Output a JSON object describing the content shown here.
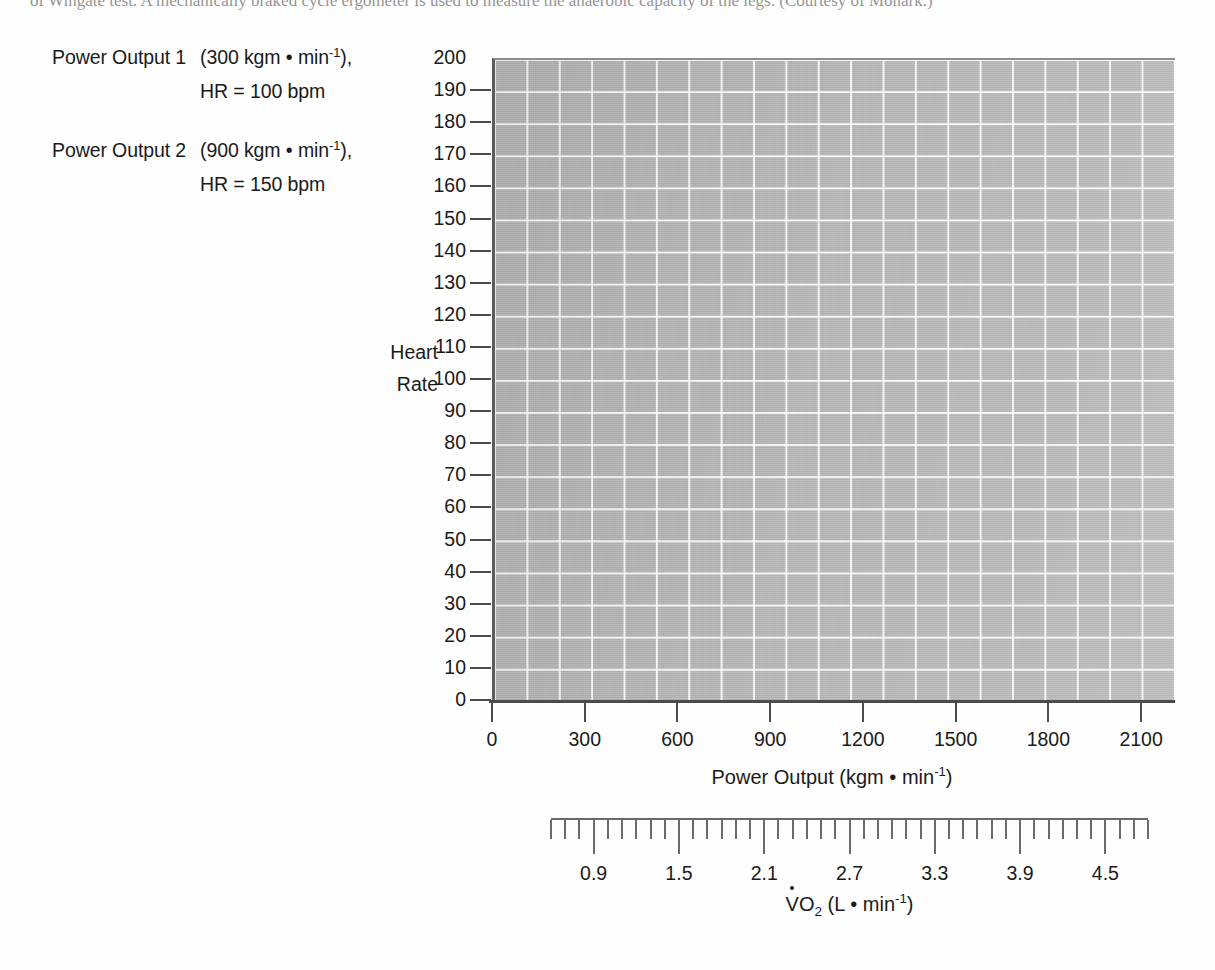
{
  "page": {
    "cut_top_line": "of Wingate test. A mechanically braked cycle ergometer is used to measure the anaerobic capacity of the legs. (Courtesy of Monark.)",
    "background_color": "#ffffff",
    "plot_fill_color": "#b9b9b9",
    "grid_color": "#ffffff",
    "axis_color": "#4b4b4b"
  },
  "legend": {
    "rows": [
      {
        "key": "Power Output 1",
        "value_prefix": "(300 kgm ",
        "value_bullet": "•",
        "value_unit": " min",
        "value_exponent": "-1",
        "value_suffix": "),",
        "sub": "HR = 100 bpm"
      },
      {
        "key": "Power Output 2",
        "value_prefix": "(900 kgm ",
        "value_bullet": "•",
        "value_unit": " min",
        "value_exponent": "-1",
        "value_suffix": "),",
        "sub": "HR = 150 bpm"
      }
    ]
  },
  "chart_data": {
    "type": "scatter",
    "title": "",
    "subtitle": "",
    "grid": true,
    "legend_position": "upper-left-outside",
    "series": [
      {
        "name": "Power Output 1",
        "power_output_kgm_per_min": 300,
        "heart_rate_bpm": 100,
        "values": []
      },
      {
        "name": "Power Output 2",
        "power_output_kgm_per_min": 900,
        "heart_rate_bpm": 150,
        "values": []
      }
    ],
    "ylabel": "Heart\nRate",
    "ylabel_line1": "Heart",
    "ylabel_line2": "Rate",
    "ylim": [
      0,
      200
    ],
    "yticks": [
      0,
      10,
      20,
      30,
      40,
      50,
      60,
      70,
      80,
      90,
      100,
      110,
      120,
      130,
      140,
      150,
      160,
      170,
      180,
      190,
      200
    ],
    "ytick_labels": [
      "0",
      "10",
      "20",
      "30",
      "40",
      "50",
      "60",
      "70",
      "80",
      "90",
      "100",
      "110",
      "120",
      "130",
      "140",
      "150",
      "160",
      "170",
      "180",
      "190",
      "200"
    ],
    "xlabel_prefix": "Power Output (kgm ",
    "xlabel_bullet": "•",
    "xlabel_unit": " min",
    "xlabel_exponent": "-1",
    "xlabel_suffix": ")",
    "xlim": [
      0,
      2200
    ],
    "xticks": [
      0,
      300,
      600,
      900,
      1200,
      1500,
      1800,
      2100
    ],
    "xtick_labels": [
      "0",
      "300",
      "600",
      "900",
      "1200",
      "1500",
      "1800",
      "2100"
    ],
    "secondary_axis": {
      "label_prefix": "O",
      "label_sub": "2",
      "label_rest": " (L ",
      "label_bullet": "•",
      "label_unit": " min",
      "label_exponent": "-1",
      "label_suffix": ")",
      "label_v": "V",
      "major_ticks": [
        0.9,
        1.5,
        2.1,
        2.7,
        3.3,
        3.9,
        4.5
      ],
      "major_tick_labels": [
        "0.9",
        "1.5",
        "2.1",
        "2.7",
        "3.3",
        "3.9",
        "4.5"
      ],
      "minor_tick_step": 0.1,
      "range": [
        0.6,
        4.8
      ]
    }
  }
}
